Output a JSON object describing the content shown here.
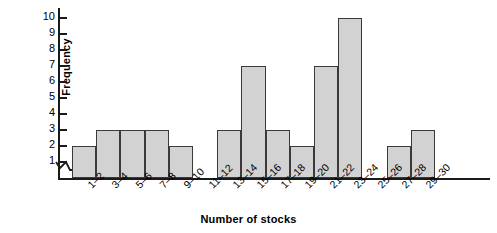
{
  "chart_data": {
    "type": "bar",
    "title": "",
    "subtitle": "",
    "xlabel": "Number of stocks",
    "ylabel": "Frequency",
    "categories": [
      "1–2",
      "3–4",
      "5–6",
      "7–8",
      "9–10",
      "11–12",
      "13–14",
      "15–16",
      "17–18",
      "19–20",
      "21–22",
      "23–24",
      "25–26",
      "27–28",
      "29–30"
    ],
    "values": [
      2,
      3,
      3,
      3,
      2,
      0,
      3,
      7,
      3,
      2,
      7,
      10,
      0,
      2,
      3
    ],
    "ylim": [
      0,
      10
    ],
    "ytick_labels": [
      "1",
      "2",
      "3",
      "4",
      "5",
      "6",
      "7",
      "8",
      "9",
      "10"
    ],
    "ytick_values": [
      1,
      2,
      3,
      4,
      5,
      6,
      7,
      8,
      9,
      10
    ],
    "grid": false,
    "legend": false,
    "bar_fill_color": "#d2d2d2",
    "bar_border_color": "#3a3a3a",
    "axis_color": "#1a1a1a",
    "text_color": "#000000",
    "axis_break": true,
    "xtick_label_rotation": -45
  }
}
